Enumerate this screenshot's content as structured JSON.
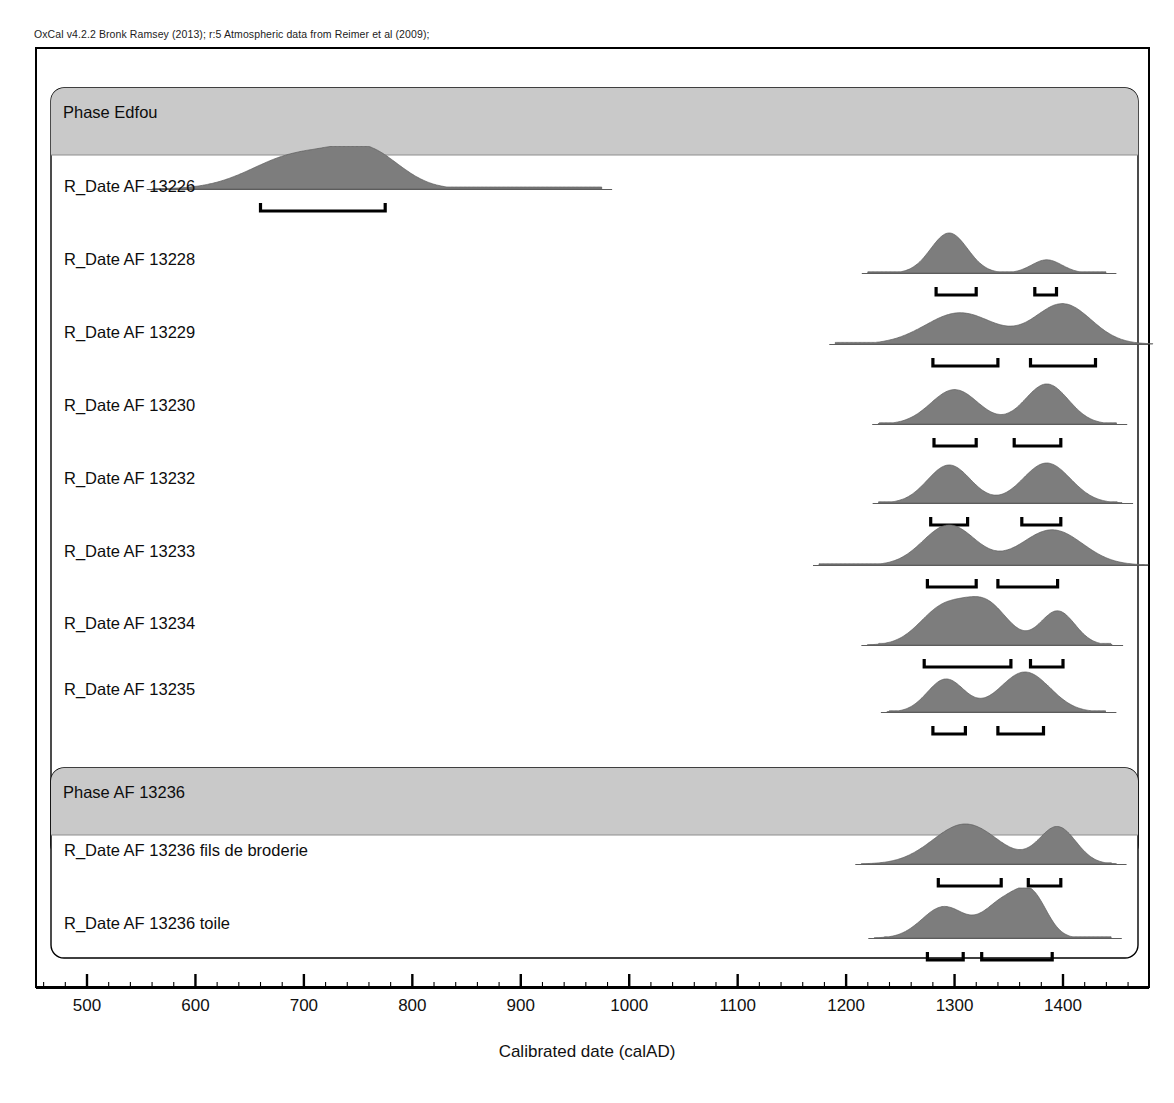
{
  "credit": {
    "text": "OxCal v4.2.2 Bronk Ramsey (2013); r:5 Atmospheric data from Reimer et al (2009);"
  },
  "axis": {
    "title": "Calibrated date (calAD)",
    "tick_labels": [
      "500",
      "600",
      "700",
      "800",
      "900",
      "1000",
      "1100",
      "1200",
      "1300",
      "1400"
    ],
    "minor_tick_step": 20
  },
  "phases": [
    {
      "label": "Phase Edfou"
    },
    {
      "label": "Phase AF 13236"
    }
  ],
  "rows": [
    {
      "label": "R_Date AF 13226"
    },
    {
      "label": "R_Date AF 13228"
    },
    {
      "label": "R_Date AF 13229"
    },
    {
      "label": "R_Date AF 13230"
    },
    {
      "label": "R_Date AF 13232"
    },
    {
      "label": "R_Date AF 13233"
    },
    {
      "label": "R_Date AF 13234"
    },
    {
      "label": "R_Date AF 13235"
    },
    {
      "label": "R_Date AF 13236 fils de broderie"
    },
    {
      "label": "R_Date AF 13236 toile"
    }
  ],
  "colors": {
    "distribution_fill": "#7d7d7d",
    "phase_header_band": "#c9c9c9",
    "frame_stroke": "#000000",
    "baseline_stroke": "#4a4a4a"
  },
  "chart_data": {
    "type": "area",
    "title": "",
    "xlabel": "Calibrated date (calAD)",
    "ylabel": "",
    "xlim": [
      440,
      1460
    ],
    "grid": false,
    "legend": "none",
    "series": [
      {
        "name": "R_Date AF 13226",
        "peaks": [
          {
            "center": 695,
            "height": 1.0,
            "width": 42
          },
          {
            "center": 760,
            "height": 0.95,
            "width": 30
          }
        ],
        "tail": {
          "from": 790,
          "to": 975,
          "height": 0.06
        },
        "ranges": [
          [
            660,
            775
          ]
        ]
      },
      {
        "name": "R_Date AF 13228",
        "peaks": [
          {
            "center": 1295,
            "height": 1.0,
            "width": 17
          },
          {
            "center": 1385,
            "height": 0.33,
            "width": 14
          }
        ],
        "tail": {
          "from": 1220,
          "to": 1440,
          "height": 0.03
        },
        "ranges": [
          [
            1283,
            1320
          ],
          [
            1374,
            1394
          ]
        ]
      },
      {
        "name": "R_Date AF 13229",
        "peaks": [
          {
            "center": 1305,
            "height": 0.78,
            "width": 32
          },
          {
            "center": 1400,
            "height": 1.0,
            "width": 26
          }
        ],
        "tail": {
          "from": 1190,
          "to": 1460,
          "height": 0.04
        },
        "ranges": [
          [
            1280,
            1340
          ],
          [
            1370,
            1430
          ]
        ]
      },
      {
        "name": "R_Date AF 13230",
        "peaks": [
          {
            "center": 1300,
            "height": 0.86,
            "width": 22
          },
          {
            "center": 1385,
            "height": 1.0,
            "width": 20
          }
        ],
        "tail": {
          "from": 1230,
          "to": 1450,
          "height": 0.03
        },
        "ranges": [
          [
            1281,
            1320
          ],
          [
            1355,
            1398
          ]
        ]
      },
      {
        "name": "R_Date AF 13232",
        "peaks": [
          {
            "center": 1295,
            "height": 0.95,
            "width": 20
          },
          {
            "center": 1385,
            "height": 1.0,
            "width": 22
          }
        ],
        "tail": {
          "from": 1230,
          "to": 1450,
          "height": 0.03
        },
        "ranges": [
          [
            1278,
            1312
          ],
          [
            1362,
            1398
          ]
        ]
      },
      {
        "name": "R_Date AF 13233",
        "peaks": [
          {
            "center": 1295,
            "height": 1.0,
            "width": 24
          },
          {
            "center": 1390,
            "height": 0.88,
            "width": 28
          }
        ],
        "tail": {
          "from": 1175,
          "to": 1450,
          "height": 0.03
        },
        "ranges": [
          [
            1275,
            1320
          ],
          [
            1340,
            1395
          ]
        ]
      },
      {
        "name": "R_Date AF 13234",
        "peaks": [
          {
            "center": 1290,
            "height": 0.92,
            "width": 22
          },
          {
            "center": 1330,
            "height": 0.96,
            "width": 20
          },
          {
            "center": 1395,
            "height": 0.85,
            "width": 16
          }
        ],
        "tail": {
          "from": 1230,
          "to": 1445,
          "height": 0.04
        },
        "ranges": [
          [
            1272,
            1352
          ],
          [
            1370,
            1400
          ]
        ]
      },
      {
        "name": "R_Date AF 13235",
        "peaks": [
          {
            "center": 1292,
            "height": 0.82,
            "width": 17
          },
          {
            "center": 1365,
            "height": 1.0,
            "width": 23
          }
        ],
        "tail": {
          "from": 1240,
          "to": 1440,
          "height": 0.03
        },
        "ranges": [
          [
            1280,
            1310
          ],
          [
            1340,
            1382
          ]
        ]
      },
      {
        "name": "R_Date AF 13236 fils de broderie",
        "peaks": [
          {
            "center": 1310,
            "height": 1.0,
            "width": 30
          },
          {
            "center": 1395,
            "height": 0.92,
            "width": 17
          }
        ],
        "tail": {
          "from": 1245,
          "to": 1445,
          "height": 0.03
        },
        "ranges": [
          [
            1285,
            1343
          ],
          [
            1368,
            1398
          ]
        ]
      },
      {
        "name": "R_Date AF 13236 toile",
        "peaks": [
          {
            "center": 1290,
            "height": 0.78,
            "width": 20
          },
          {
            "center": 1345,
            "height": 0.88,
            "width": 18
          },
          {
            "center": 1372,
            "height": 0.92,
            "width": 14
          }
        ],
        "tail": {
          "from": 1235,
          "to": 1445,
          "height": 0.03
        },
        "ranges": [
          [
            1275,
            1308
          ],
          [
            1325,
            1390
          ]
        ]
      }
    ]
  }
}
